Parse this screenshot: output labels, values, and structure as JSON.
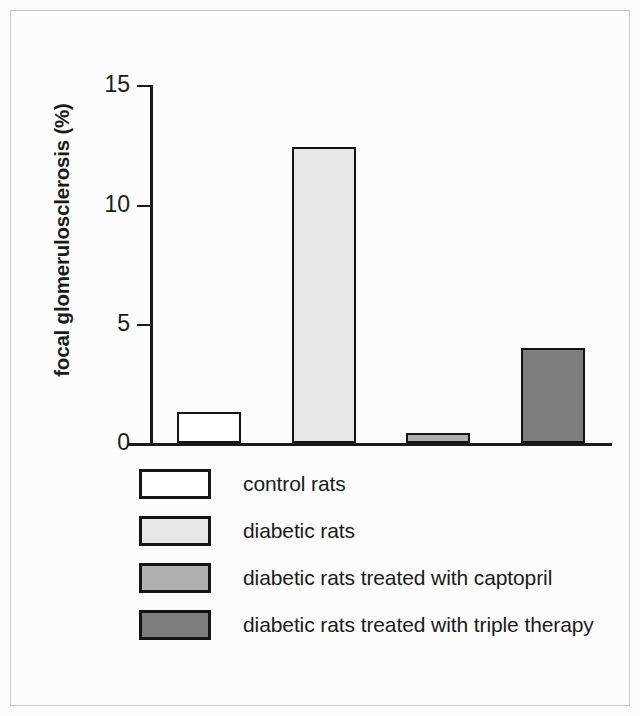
{
  "figure": {
    "background_color": "#fbfbfb",
    "frame_color": "#c8c8c8",
    "axis_color": "#1a1a1a"
  },
  "chart_data": {
    "type": "bar",
    "title": "",
    "subtitle": "",
    "xlabel": "",
    "ylabel": "focal glomerulosclerosis (%)",
    "categories": [
      "control rats",
      "diabetic rats",
      "diabetic rats treated with captopril",
      "diabetic rats treated with triple therapy"
    ],
    "values": [
      1.3,
      12.4,
      0.4,
      4.0
    ],
    "ylim": [
      0,
      15
    ],
    "yticks": [
      0,
      5,
      10,
      15
    ],
    "ytick_labels": [
      "0",
      "5",
      "10",
      "15"
    ],
    "xticks": [],
    "xtick_labels": [],
    "grid": false,
    "legend_position": "below-axes",
    "bar_colors": [
      "#ffffff",
      "#e6e6e6",
      "#b0b0b0",
      "#7d7d7d"
    ],
    "bar_edge_color": "#141414",
    "series": [
      {
        "name": "focal glomerulosclerosis (%)",
        "values": [
          1.3,
          12.4,
          0.4,
          4.0
        ]
      }
    ]
  },
  "axis": {
    "y_title": "focal glomerulosclerosis (%)",
    "ticks": [
      {
        "label": "15",
        "value": 15
      },
      {
        "label": "10",
        "value": 10
      },
      {
        "label": "5",
        "value": 5
      },
      {
        "label": "0",
        "value": 0
      }
    ]
  },
  "legend": {
    "items": [
      {
        "label": "control rats",
        "color": "#ffffff",
        "value": 1.3
      },
      {
        "label": "diabetic rats",
        "color": "#e6e6e6",
        "value": 12.4
      },
      {
        "label": "diabetic rats treated with captopril",
        "color": "#b0b0b0",
        "value": 0.4
      },
      {
        "label": "diabetic rats treated with triple therapy",
        "color": "#7d7d7d",
        "value": 4.0
      }
    ]
  }
}
